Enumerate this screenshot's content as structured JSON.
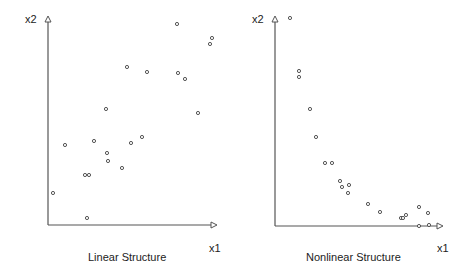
{
  "chart_data": [
    {
      "type": "scatter",
      "title": "Linear Structure",
      "xlabel": "x1",
      "ylabel": "x2",
      "grid": false,
      "axes": {
        "ticks": false,
        "arrowheads": true
      },
      "pixel_frame": {
        "origin": [
          48,
          225
        ],
        "x_end": 215,
        "y_end": 18
      },
      "points_px": [
        [
          177,
          24
        ],
        [
          212,
          38
        ],
        [
          210,
          44
        ],
        [
          127,
          67
        ],
        [
          147,
          72
        ],
        [
          178,
          73
        ],
        [
          185,
          79
        ],
        [
          106,
          109
        ],
        [
          198,
          113
        ],
        [
          142,
          137
        ],
        [
          65,
          145
        ],
        [
          94,
          141
        ],
        [
          131,
          143
        ],
        [
          107,
          153
        ],
        [
          108,
          161
        ],
        [
          122,
          168
        ],
        [
          85,
          175
        ],
        [
          89,
          175
        ],
        [
          53,
          193
        ],
        [
          87,
          218
        ]
      ]
    },
    {
      "type": "scatter",
      "title": "Nonlinear Structure",
      "xlabel": "x1",
      "ylabel": "x2",
      "grid": false,
      "axes": {
        "ticks": false,
        "arrowheads": true
      },
      "pixel_frame": {
        "origin": [
          275,
          226
        ],
        "x_end": 441,
        "y_end": 18
      },
      "points_px": [
        [
          290,
          18
        ],
        [
          299,
          71
        ],
        [
          299,
          77
        ],
        [
          310,
          109
        ],
        [
          316,
          137
        ],
        [
          325,
          163
        ],
        [
          332,
          163
        ],
        [
          340,
          181
        ],
        [
          349,
          185
        ],
        [
          342,
          187
        ],
        [
          348,
          193
        ],
        [
          368,
          204
        ],
        [
          380,
          212
        ],
        [
          401,
          218
        ],
        [
          403,
          218
        ],
        [
          406,
          215
        ],
        [
          419,
          207
        ],
        [
          428,
          213
        ],
        [
          419,
          226
        ],
        [
          429,
          225
        ]
      ]
    }
  ],
  "panels": [
    {
      "title": "Linear Structure",
      "xlabel": "x1",
      "ylabel": "x2"
    },
    {
      "title": "Nonlinear Structure",
      "xlabel": "x1",
      "ylabel": "x2"
    }
  ]
}
